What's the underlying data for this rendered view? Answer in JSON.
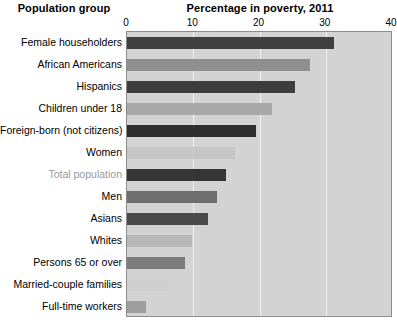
{
  "headings": {
    "group": "Population group",
    "value": "Percentage in poverty, 2011"
  },
  "chart_data": {
    "type": "bar",
    "orientation": "horizontal",
    "title": "Percentage in poverty, 2011",
    "xlabel": "Percentage in poverty, 2011",
    "ylabel": "Population group",
    "xlim": [
      0,
      40
    ],
    "ticks": [
      0,
      10,
      20,
      30,
      40
    ],
    "tick_labels": [
      "0",
      "10",
      "20",
      "30",
      "40"
    ],
    "grid": true,
    "legend": "none",
    "plot_background": "#d3d3d3",
    "categories": [
      "Female householders",
      "African Americans",
      "Hispanics",
      "Children under 18",
      "Foreign-born (not citizens)",
      "Women",
      "Total population",
      "Men",
      "Asians",
      "Whites",
      "Persons 65 or over",
      "Married-couple families",
      "Full-time workers"
    ],
    "values": [
      31.2,
      27.6,
      25.3,
      21.9,
      19.4,
      16.3,
      15.0,
      13.6,
      12.3,
      9.8,
      8.7,
      6.2,
      2.8
    ],
    "bar_colors": [
      "#404040",
      "#8f8f8f",
      "#3d3d3d",
      "#a8a8a8",
      "#2e2e2e",
      "#c6c6c6",
      "#353535",
      "#6e6e6e",
      "#4a4a4a",
      "#b8b8b8",
      "#7c7c7c",
      "#cfcfcf",
      "#9e9e9e"
    ],
    "highlighted_category": "Total population",
    "highlight_label_color": "#9a9a9a"
  }
}
